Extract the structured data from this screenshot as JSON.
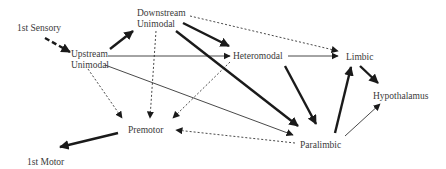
{
  "diagram": {
    "type": "flow-diagram",
    "nodes": {
      "sensory": {
        "label": "1st Sensory"
      },
      "upstream": {
        "line1": "Upstream",
        "line2": "Unimodal"
      },
      "downstream": {
        "line1": "Downstream",
        "line2": "Unimodal"
      },
      "heteromodal": {
        "label": "Heteromodal"
      },
      "limbic": {
        "label": "Limbic"
      },
      "hypothalamus": {
        "label": "Hypothalamus"
      },
      "premotor": {
        "label": "Premotor"
      },
      "paralimbic": {
        "label": "Paralimbic"
      },
      "motor": {
        "label": "1st Motor"
      }
    },
    "edges": [
      {
        "from": "1st Sensory",
        "to": "Upstream Unimodal",
        "style": "thick-dashed"
      },
      {
        "from": "Upstream Unimodal",
        "to": "Downstream Unimodal",
        "style": "thick"
      },
      {
        "from": "Upstream Unimodal",
        "to": "Heteromodal",
        "style": "thin"
      },
      {
        "from": "Upstream Unimodal",
        "to": "Paralimbic",
        "style": "thin"
      },
      {
        "from": "Upstream Unimodal",
        "to": "Premotor",
        "style": "dotted"
      },
      {
        "from": "Downstream Unimodal",
        "to": "Heteromodal",
        "style": "thick"
      },
      {
        "from": "Downstream Unimodal",
        "to": "Paralimbic",
        "style": "thick"
      },
      {
        "from": "Downstream Unimodal",
        "to": "Limbic",
        "style": "dotted"
      },
      {
        "from": "Downstream Unimodal",
        "to": "Premotor",
        "style": "dotted"
      },
      {
        "from": "Heteromodal",
        "to": "Limbic",
        "style": "thin"
      },
      {
        "from": "Heteromodal",
        "to": "Paralimbic",
        "style": "thick"
      },
      {
        "from": "Heteromodal",
        "to": "Premotor",
        "style": "dotted"
      },
      {
        "from": "Limbic",
        "to": "Hypothalamus",
        "style": "thick"
      },
      {
        "from": "Paralimbic",
        "to": "Limbic",
        "style": "thick"
      },
      {
        "from": "Paralimbic",
        "to": "Hypothalamus",
        "style": "thin"
      },
      {
        "from": "Paralimbic",
        "to": "Premotor",
        "style": "dotted"
      },
      {
        "from": "Premotor",
        "to": "1st Motor",
        "style": "thick"
      }
    ],
    "colors": {
      "line": "#1a1a1a",
      "text": "#3a3a3a",
      "background": "#ffffff"
    }
  }
}
